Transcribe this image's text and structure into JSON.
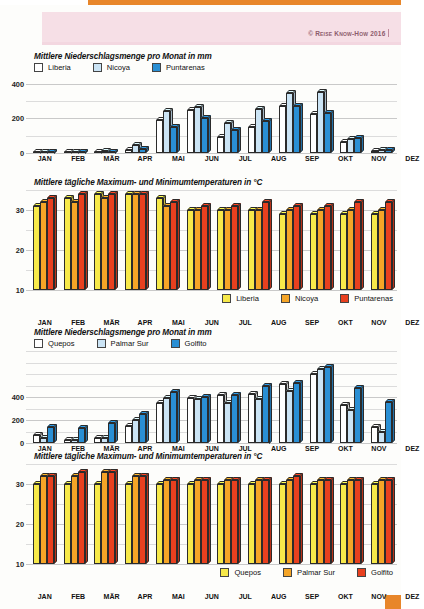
{
  "page": {
    "copyright": "© Reise Know-How 2016",
    "accent_orange": "#e8862a",
    "pink_band": "#f6dfe6"
  },
  "months": [
    "JAN",
    "FEB",
    "MÄR",
    "APR",
    "MAI",
    "JUN",
    "JUL",
    "AUG",
    "SEP",
    "OKT",
    "NOV",
    "DEZ"
  ],
  "titles": {
    "precip": "Mittlere Niederschlagsmenge pro Monat in mm",
    "temp": "Mittlere tägliche Maximum- und Minimumtemperaturen in °C"
  },
  "colors": {
    "precip_s1": "#ffffff",
    "precip_s2": "#cbe4f5",
    "precip_s3": "#2a8fd4",
    "temp_s1": "#f7e94a",
    "temp_s2": "#f5a527",
    "temp_s3": "#e8401f"
  },
  "chart_data": [
    {
      "id": "precip-north",
      "type": "bar",
      "title": "Mittlere Niederschlagsmenge pro Monat in mm",
      "xlabel": "",
      "ylabel": "mm",
      "ylim": [
        0,
        450
      ],
      "yticks": [
        0,
        200,
        400
      ],
      "grid": true,
      "legend_position": "top-left",
      "categories": [
        "JAN",
        "FEB",
        "MÄR",
        "APR",
        "MAI",
        "JUN",
        "JUL",
        "AUG",
        "SEP",
        "OKT",
        "NOV",
        "DEZ"
      ],
      "series": [
        {
          "name": "Liberia",
          "color": "#ffffff",
          "values": [
            2,
            2,
            5,
            18,
            190,
            250,
            95,
            150,
            270,
            225,
            65,
            10
          ]
        },
        {
          "name": "Nicoya",
          "color": "#cbe4f5",
          "values": [
            5,
            8,
            12,
            45,
            240,
            265,
            175,
            255,
            345,
            350,
            80,
            15
          ]
        },
        {
          "name": "Puntarenas",
          "color": "#2a8fd4",
          "values": [
            3,
            5,
            8,
            25,
            150,
            200,
            130,
            185,
            270,
            230,
            85,
            18
          ]
        }
      ]
    },
    {
      "id": "temp-north",
      "type": "bar",
      "title": "Mittlere tägliche Maximum- und Minimumtemperaturen in °C",
      "xlabel": "",
      "ylabel": "°C",
      "ylim": [
        10,
        35
      ],
      "yticks": [
        10,
        20,
        30
      ],
      "grid": true,
      "legend_position": "bottom-right",
      "categories": [
        "JAN",
        "FEB",
        "MÄR",
        "APR",
        "MAI",
        "JUN",
        "JUL",
        "AUG",
        "SEP",
        "OKT",
        "NOV",
        "DEZ"
      ],
      "series": [
        {
          "name": "Liberia",
          "color": "#f7e94a",
          "values": [
            31,
            33,
            34,
            34,
            33,
            30,
            30,
            30,
            29,
            29,
            29,
            29
          ]
        },
        {
          "name": "Nicoya",
          "color": "#f5a527",
          "values": [
            32,
            32,
            33,
            34,
            31,
            30,
            30,
            30,
            30,
            30,
            30,
            30
          ]
        },
        {
          "name": "Puntarenas",
          "color": "#e8401f",
          "values": [
            33,
            34,
            34,
            34,
            32,
            31,
            31,
            32,
            31,
            31,
            32,
            32
          ]
        }
      ]
    },
    {
      "id": "precip-south",
      "type": "bar",
      "title": "Mittlere Niederschlagsmenge pro Monat in mm",
      "xlabel": "",
      "ylabel": "mm",
      "ylim": [
        0,
        800
      ],
      "yticks": [
        0,
        200,
        400
      ],
      "grid": true,
      "legend_position": "top-left",
      "categories": [
        "JAN",
        "FEB",
        "MÄR",
        "APR",
        "MAI",
        "JUN",
        "JUL",
        "AUG",
        "SEP",
        "OKT",
        "NOV",
        "DEZ"
      ],
      "series": [
        {
          "name": "Quepos",
          "color": "#ffffff",
          "values": [
            70,
            30,
            40,
            150,
            350,
            390,
            415,
            430,
            510,
            600,
            330,
            140
          ]
        },
        {
          "name": "Palmar Sur",
          "color": "#cbe4f5",
          "values": [
            45,
            30,
            45,
            200,
            390,
            380,
            350,
            380,
            450,
            640,
            290,
            95
          ]
        },
        {
          "name": "Golfito",
          "color": "#2a8fd4",
          "values": [
            140,
            130,
            175,
            255,
            440,
            400,
            415,
            500,
            520,
            660,
            475,
            355
          ]
        }
      ]
    },
    {
      "id": "temp-south",
      "type": "bar",
      "title": "Mittlere tägliche Maximum- und Minimumtemperaturen in °C",
      "xlabel": "",
      "ylabel": "°C",
      "ylim": [
        10,
        35
      ],
      "yticks": [
        10,
        20,
        30
      ],
      "grid": true,
      "legend_position": "bottom-right",
      "categories": [
        "JAN",
        "FEB",
        "MÄR",
        "APR",
        "MAI",
        "JUN",
        "JUL",
        "AUG",
        "SEP",
        "OKT",
        "NOV",
        "DEZ"
      ],
      "series": [
        {
          "name": "Quepos",
          "color": "#f7e94a",
          "values": [
            30,
            30,
            30,
            30,
            30,
            30,
            30,
            30,
            30,
            30,
            30,
            30
          ]
        },
        {
          "name": "Palmar Sur",
          "color": "#f5a527",
          "values": [
            32,
            32,
            33,
            32,
            31,
            31,
            31,
            31,
            31,
            31,
            31,
            31
          ]
        },
        {
          "name": "Golfito",
          "color": "#e8401f",
          "values": [
            32,
            33,
            33,
            32,
            31,
            31,
            31,
            31,
            32,
            31,
            31,
            31
          ]
        }
      ]
    }
  ]
}
